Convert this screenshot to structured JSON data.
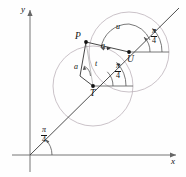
{
  "figure": {
    "kind": "geometry-diagram",
    "background": "#fefefe",
    "stroke_axis": "#555555",
    "stroke_line": "#333333",
    "stroke_circle": "#b9aeb6",
    "stroke_arc": "#555555",
    "axes": {
      "x_label": "x",
      "y_label": "y",
      "origin": {
        "x": 30,
        "y": 155
      }
    },
    "points": [
      {
        "id": "P",
        "label": "P",
        "x": 86,
        "y": 42
      },
      {
        "id": "T",
        "label": "T",
        "x": 93,
        "y": 86
      },
      {
        "id": "U",
        "label": "U",
        "x": 129,
        "y": 52
      }
    ],
    "labels": [
      {
        "id": "a-upper",
        "text": "a",
        "x": 103,
        "y": 46
      },
      {
        "id": "a-lower",
        "text": "a",
        "x": 77,
        "y": 68
      },
      {
        "id": "t",
        "text": "t",
        "x": 95,
        "y": 64
      },
      {
        "id": "u",
        "text": "u",
        "x": 117,
        "y": 28
      }
    ],
    "angle_fractions": [
      {
        "id": "angle-origin",
        "numerator": "π",
        "denominator": "4",
        "x": 44,
        "y": 130
      },
      {
        "id": "angle-at-T",
        "numerator": "π",
        "denominator": "4",
        "x": 117,
        "y": 68
      },
      {
        "id": "angle-at-U",
        "numerator": "π",
        "denominator": "4",
        "x": 153,
        "y": 30
      }
    ],
    "circles": [
      {
        "id": "circle-T",
        "cx": 93,
        "cy": 86,
        "r": 40
      },
      {
        "id": "circle-U",
        "cx": 129,
        "cy": 52,
        "r": 40
      }
    ],
    "ray": {
      "angle_deg": 45,
      "from": {
        "x": 30,
        "y": 155
      },
      "to": {
        "x": 179,
        "y": 11
      }
    }
  }
}
